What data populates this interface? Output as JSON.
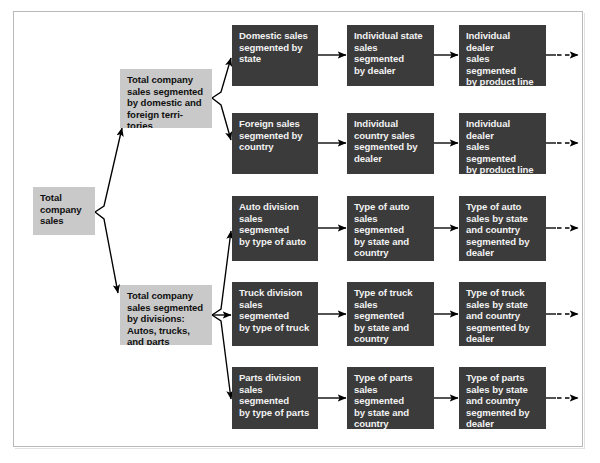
{
  "diagram": {
    "colors": {
      "dark_box": "#3b3b3b",
      "gray_box": "#c9c9c9",
      "dark_text": "#f2f2f2",
      "gray_text": "#101010",
      "frame_border": "#b9b9b9",
      "arrow": "#000000",
      "background": "#ffffff"
    },
    "level1": [
      {
        "id": "total-company-sales",
        "label": "Total\ncompany\nsales",
        "style": "gray"
      }
    ],
    "level2": [
      {
        "id": "territories",
        "label": "Total company\nsales segmented\nby domestic and\nforeign terri-\ntories",
        "style": "gray"
      },
      {
        "id": "divisions",
        "label": "Total company\nsales segmented\nby divisions:\nAutos, trucks,\nand parts",
        "style": "gray"
      }
    ],
    "rows": [
      {
        "id": "row-domestic",
        "parent": "territories",
        "boxes": [
          {
            "id": "domestic-sales-by-state",
            "label": "Domestic sales\nsegmented by\nstate"
          },
          {
            "id": "individual-state-sales-by-dealer",
            "label": "Individual state\nsales segmented\nby dealer"
          },
          {
            "id": "individual-dealer-sales-by-product-line-domestic",
            "label": "Individual dealer\nsales segmented\nby product line\n(autos, trucks,\nparts)"
          }
        ],
        "trailing_arrow": "dashed"
      },
      {
        "id": "row-foreign",
        "parent": "territories",
        "boxes": [
          {
            "id": "foreign-sales-by-country",
            "label": "Foreign sales\nsegmented by\ncountry"
          },
          {
            "id": "individual-country-sales-by-dealer",
            "label": "Individual\ncountry sales\nsegmented by\ndealer"
          },
          {
            "id": "individual-dealer-sales-by-product-line-foreign",
            "label": "Individual dealer\nsales segmented\nby product line\n(autos, trucks,\nparts)"
          }
        ],
        "trailing_arrow": "dashed"
      },
      {
        "id": "row-auto",
        "parent": "divisions",
        "boxes": [
          {
            "id": "auto-division-sales-by-type",
            "label": "Auto division\nsales segmented\nby type of auto"
          },
          {
            "id": "type-of-auto-sales-by-state-country",
            "label": "Type of auto\nsales segmented\nby state and\ncountry"
          },
          {
            "id": "type-of-auto-sales-by-dealer",
            "label": "Type of auto\nsales by state\nand country\nsegmented by\ndealer"
          }
        ],
        "trailing_arrow": "dashed"
      },
      {
        "id": "row-truck",
        "parent": "divisions",
        "boxes": [
          {
            "id": "truck-division-sales-by-type",
            "label": "Truck division\nsales segmented\nby type of truck"
          },
          {
            "id": "type-of-truck-sales-by-state-country",
            "label": "Type of truck\nsales segmented\nby state and\ncountry"
          },
          {
            "id": "type-of-truck-sales-by-dealer",
            "label": "Type of truck\nsales by state\nand country\nsegmented by\ndealer"
          }
        ],
        "trailing_arrow": "dashed"
      },
      {
        "id": "row-parts",
        "parent": "divisions",
        "boxes": [
          {
            "id": "parts-division-sales-by-type",
            "label": "Parts division\nsales segmented\nby type of parts"
          },
          {
            "id": "type-of-parts-sales-by-state-country",
            "label": "Type of parts\nsales segmented\nby state and\ncountry"
          },
          {
            "id": "type-of-parts-sales-by-dealer",
            "label": "Type of parts\nsales by state\nand country\nsegmented by\ndealer"
          }
        ],
        "trailing_arrow": "dashed"
      }
    ]
  }
}
